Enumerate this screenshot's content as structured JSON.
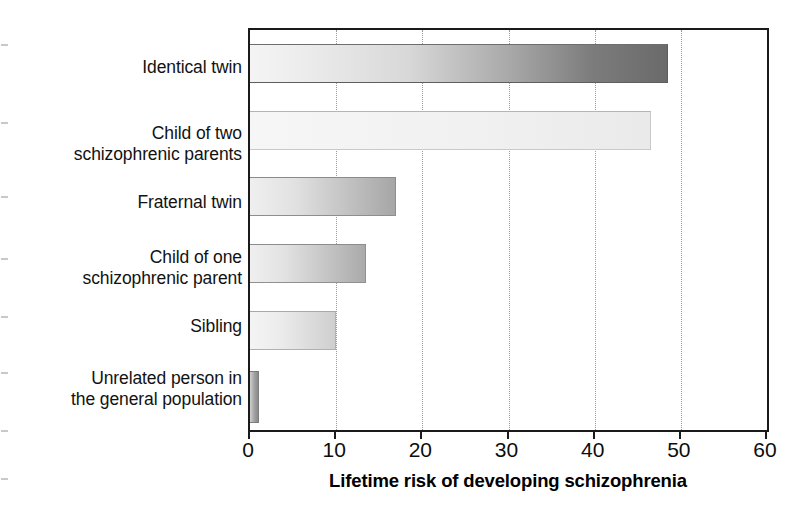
{
  "chart_data": {
    "type": "bar",
    "orientation": "horizontal",
    "title": "",
    "xlabel": "Lifetime risk of developing schizophrenia",
    "ylabel": "",
    "xlim": [
      0,
      60
    ],
    "xticks": [
      0,
      10,
      20,
      30,
      40,
      50,
      60
    ],
    "xtick_labels": [
      "0",
      "10",
      "20",
      "30",
      "40",
      "50",
      "60"
    ],
    "grid": "vertical-dotted",
    "legend": "none",
    "categories": [
      "Identical twin",
      "Child of two schizophrenic parents",
      "Fraternal twin",
      "Child of one schizophrenic parent",
      "Sibling",
      "Unrelated person in the general population"
    ],
    "category_lines": [
      [
        "Identical twin"
      ],
      [
        "Child of two",
        "schizophrenic parents"
      ],
      [
        "Fraternal twin"
      ],
      [
        "Child of one",
        "schizophrenic parent"
      ],
      [
        "Sibling"
      ],
      [
        "Unrelated person in",
        "the general population"
      ]
    ],
    "values": [
      48.5,
      46.5,
      17,
      13.5,
      10,
      1
    ],
    "bar_colors": [
      "#6a6a6a",
      "#f1f1f1",
      "#a6a6a6",
      "#aaaaaa",
      "#cfcfcf",
      "#8a8a8a"
    ],
    "axis_color": "#1a1a1a",
    "gridline_color": "#9a9a9a",
    "background": "#ffffff"
  }
}
